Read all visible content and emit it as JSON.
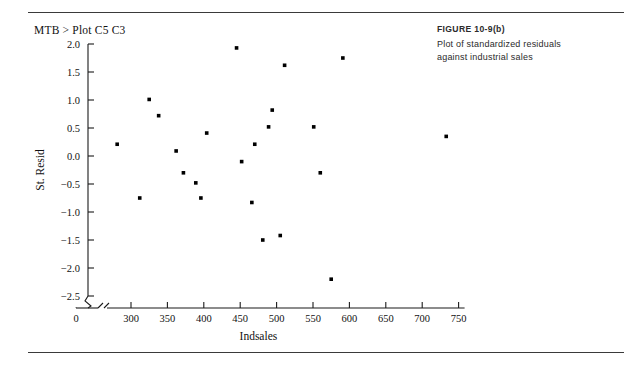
{
  "page": {
    "command_line": "MTB > Plot C5 C3",
    "rule_color": "#3a3a3a"
  },
  "caption": {
    "figure_number": "FIGURE 10-9(b)",
    "line1": "Plot of standardized residuals",
    "line2": "against industrial sales"
  },
  "chart_data": {
    "type": "scatter",
    "title": "",
    "xlabel": "Indsales",
    "ylabel": "St. Resid",
    "xlim": [
      280,
      750
    ],
    "ylim": [
      -2.5,
      2.0
    ],
    "grid": false,
    "legend": null,
    "x_origin_label": "0",
    "x_axis_break": true,
    "y_axis_break": true,
    "xticks": [
      300,
      350,
      400,
      450,
      500,
      550,
      600,
      650,
      700,
      750
    ],
    "xticklabels": [
      "300",
      "350",
      "400",
      "450",
      "500",
      "550",
      "600",
      "650",
      "700",
      "750"
    ],
    "yticks": [
      2.0,
      1.5,
      1.0,
      0.5,
      0.0,
      -0.5,
      -1.0,
      -1.5,
      -2.0,
      -2.5
    ],
    "yticklabels": [
      "2.0",
      "1.5",
      "1.0",
      "0.5",
      "0.0",
      "-0.5",
      "-1.0",
      "-1.5",
      "-2.0",
      "-2.5"
    ],
    "marker": "square",
    "marker_color": "#000000",
    "points": [
      {
        "x": 281,
        "y": 0.21
      },
      {
        "x": 312,
        "y": -0.75
      },
      {
        "x": 325,
        "y": 1.01
      },
      {
        "x": 338,
        "y": 0.72
      },
      {
        "x": 362,
        "y": 0.09
      },
      {
        "x": 372,
        "y": -0.3
      },
      {
        "x": 389,
        "y": -0.48
      },
      {
        "x": 396,
        "y": -0.75
      },
      {
        "x": 404,
        "y": 0.41
      },
      {
        "x": 445,
        "y": 1.93
      },
      {
        "x": 452,
        "y": -0.1
      },
      {
        "x": 466,
        "y": -0.83
      },
      {
        "x": 470,
        "y": 0.21
      },
      {
        "x": 481,
        "y": -1.5
      },
      {
        "x": 489,
        "y": 0.52
      },
      {
        "x": 494,
        "y": 0.82
      },
      {
        "x": 505,
        "y": -1.42
      },
      {
        "x": 511,
        "y": 1.62
      },
      {
        "x": 551,
        "y": 0.52
      },
      {
        "x": 560,
        "y": -0.3
      },
      {
        "x": 575,
        "y": -2.2
      },
      {
        "x": 591,
        "y": 1.75
      },
      {
        "x": 733,
        "y": 0.35
      }
    ]
  }
}
